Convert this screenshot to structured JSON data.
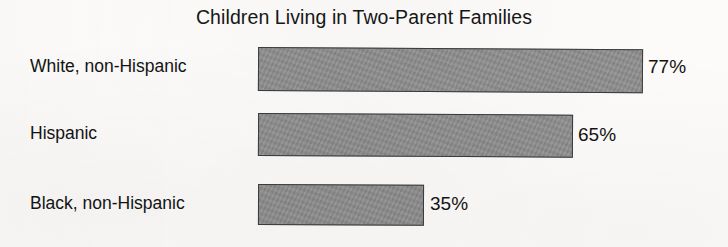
{
  "chart_data": {
    "type": "bar",
    "orientation": "horizontal",
    "title": "Children Living in Two-Parent Families",
    "xlabel": "",
    "ylabel": "",
    "categories": [
      "White, non-Hispanic",
      "Hispanic",
      "Black, non-Hispanic"
    ],
    "values": [
      77,
      65,
      35
    ],
    "value_labels": [
      "77%",
      "65%",
      "35%"
    ],
    "unit": "%",
    "xlim": [
      0,
      100
    ],
    "grid": false,
    "legend": false,
    "axis_visible": false,
    "series": [
      {
        "name": "Percent of children living in two-parent families",
        "values": [
          77,
          65,
          35
        ]
      }
    ],
    "colors": {
      "bar_fill": "#8f8f8f",
      "bar_border": "#3b3b3b",
      "text": "#131313",
      "background": "#fcfbf9"
    }
  },
  "bars": [
    {
      "label": "White, non-Hispanic",
      "value": 77,
      "value_label": "77%"
    },
    {
      "label": "Hispanic",
      "value": 65,
      "value_label": "65%"
    },
    {
      "label": "Black, non-Hispanic",
      "value": 35,
      "value_label": "35%"
    }
  ]
}
